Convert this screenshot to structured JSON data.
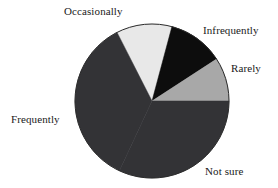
{
  "chart_data": {
    "type": "pie",
    "title": "",
    "subtitle": "",
    "xlabel": "",
    "ylabel": "",
    "legend_position": "none",
    "labels_position": "outside-callout",
    "grid": false,
    "categories": [
      "Occasionally",
      "Infrequently",
      "Rarely",
      "Not sure",
      "Frequently"
    ],
    "values": [
      12,
      12,
      9,
      32,
      35
    ],
    "units": "percent",
    "start_angle_deg": -27,
    "direction": "clockwise",
    "slices": [
      {
        "label": "Occasionally",
        "value": 12,
        "angle_deg": 42,
        "start_deg": -27,
        "end_deg": 15,
        "color": "#e8e8e8"
      },
      {
        "label": "Infrequently",
        "value": 12,
        "angle_deg": 42,
        "start_deg": 15,
        "end_deg": 57,
        "color": "#0d0d0d"
      },
      {
        "label": "Rarely",
        "value": 9,
        "angle_deg": 33,
        "start_deg": 57,
        "end_deg": 90,
        "color": "#a8a8a8"
      },
      {
        "label": "Not sure",
        "value": 32,
        "angle_deg": 115,
        "start_deg": 90,
        "end_deg": 205,
        "color": "#333336"
      },
      {
        "label": "Frequently",
        "value": 35,
        "angle_deg": 128,
        "start_deg": 205,
        "end_deg": 333,
        "color": "#333336"
      }
    ]
  },
  "labels": {
    "occasionally": "Occasionally",
    "infrequently": "Infrequently",
    "rarely": "Rarely",
    "frequently": "Frequently",
    "not_sure": "Not sure"
  },
  "colors": {
    "background": "#ffffff",
    "text": "#1a1a1a",
    "light_gray": "#e8e8e8",
    "medium_gray": "#a8a8a8",
    "dark_gray": "#333336",
    "black": "#0d0d0d",
    "outline": "#2b2b2b"
  },
  "geometry": {
    "center_x": 152,
    "center_y": 101,
    "radius": 77
  }
}
